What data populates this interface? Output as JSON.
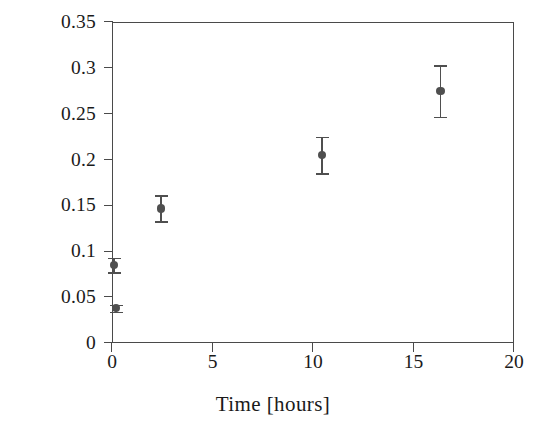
{
  "chart_data": {
    "type": "scatter",
    "title": "",
    "xlabel": "Time [hours]",
    "ylabel": "In Content (at%)",
    "xlim": [
      0,
      20
    ],
    "ylim": [
      0,
      0.35
    ],
    "xticks": [
      "0",
      "5",
      "10",
      "15",
      "20"
    ],
    "xtick_values": [
      0,
      5,
      10,
      15,
      20
    ],
    "yticks": [
      "0",
      "0.05",
      "0.1",
      "0.15",
      "0.2",
      "0.25",
      "0.3",
      "0.35"
    ],
    "ytick_values": [
      0,
      0.05,
      0.1,
      0.15,
      0.2,
      0.25,
      0.3,
      0.35
    ],
    "grid": false,
    "legend": false,
    "marker_color": "#4f4f4f",
    "axis_color": "#4a4a4a",
    "errorbars": true,
    "series": [
      {
        "name": "In Content",
        "points": [
          {
            "x": 0.05,
            "y": 0.086,
            "yerr": 0.008
          },
          {
            "x": 0.15,
            "y": 0.039,
            "yerr": 0.004
          },
          {
            "x": 2.4,
            "y": 0.148,
            "yerr": 0.014
          },
          {
            "x": 10.4,
            "y": 0.206,
            "yerr": 0.02
          },
          {
            "x": 16.3,
            "y": 0.276,
            "yerr": 0.028
          }
        ]
      }
    ]
  }
}
